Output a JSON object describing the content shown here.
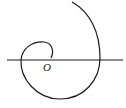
{
  "diagram": {
    "type": "polar spiral",
    "elements": [
      {
        "kind": "axis",
        "orientation": "horizontal",
        "description": "polar axis through origin"
      },
      {
        "kind": "curve",
        "description": "spiral starting at origin, winding counterclockwise outward"
      }
    ],
    "labels": {
      "origin": "O"
    },
    "colors": {
      "stroke": "#1a1a1a",
      "background": "#ffffff"
    }
  }
}
